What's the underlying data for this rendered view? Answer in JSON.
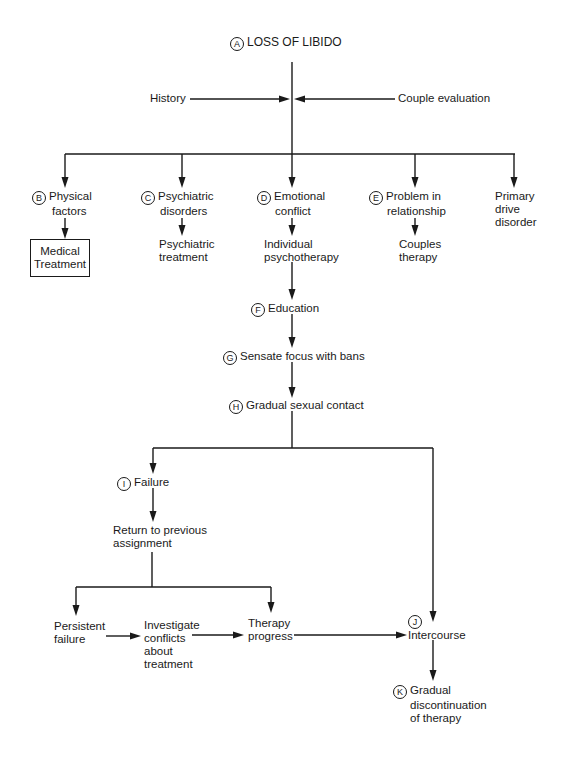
{
  "diagram": {
    "type": "flowchart",
    "title": "LOSS OF LIBIDO",
    "nodes": {
      "A": {
        "badge": "A",
        "label": "LOSS OF LIBIDO"
      },
      "history": {
        "label": "History"
      },
      "couple_eval": {
        "label": "Couple evaluation"
      },
      "B": {
        "badge": "B",
        "line1": "Physical",
        "line2": "factors"
      },
      "B_tx": {
        "line1": "Medical",
        "line2": "Treatment"
      },
      "C": {
        "badge": "C",
        "line1": "Psychiatric",
        "line2": "disorders"
      },
      "C_tx": {
        "line1": "Psychiatric",
        "line2": "treatment"
      },
      "D": {
        "badge": "D",
        "line1": "Emotional",
        "line2": "conflict"
      },
      "D_tx": {
        "line1": "Individual",
        "line2": "psychotherapy"
      },
      "E": {
        "badge": "E",
        "line1": "Problem in",
        "line2": "relationship"
      },
      "E_tx": {
        "line1": "Couples",
        "line2": "therapy"
      },
      "primary": {
        "line1": "Primary",
        "line2": "drive",
        "line3": "disorder"
      },
      "F": {
        "badge": "F",
        "label": "Education"
      },
      "G": {
        "badge": "G",
        "label": "Sensate focus with bans"
      },
      "H": {
        "badge": "H",
        "label": "Gradual sexual contact"
      },
      "I": {
        "badge": "I",
        "label": "Failure"
      },
      "return": {
        "line1": "Return to previous",
        "line2": "assignment"
      },
      "persistent": {
        "line1": "Persistent",
        "line2": "failure"
      },
      "investigate": {
        "line1": "Investigate",
        "line2": "conflicts",
        "line3": "about",
        "line4": "treatment"
      },
      "progress": {
        "line1": "Therapy",
        "line2": "progress"
      },
      "J": {
        "badge": "J",
        "label": "Intercourse"
      },
      "K": {
        "badge": "K",
        "line1": "Gradual",
        "line2": "discontinuation",
        "line3": "of therapy"
      }
    },
    "edges": [
      [
        "history",
        "A"
      ],
      [
        "couple_eval",
        "A"
      ],
      [
        "A",
        "B"
      ],
      [
        "A",
        "C"
      ],
      [
        "A",
        "D"
      ],
      [
        "A",
        "E"
      ],
      [
        "A",
        "primary"
      ],
      [
        "B",
        "B_tx"
      ],
      [
        "C",
        "C_tx"
      ],
      [
        "D",
        "D_tx"
      ],
      [
        "E",
        "E_tx"
      ],
      [
        "D_tx",
        "F"
      ],
      [
        "F",
        "G"
      ],
      [
        "G",
        "H"
      ],
      [
        "H",
        "I"
      ],
      [
        "H",
        "J"
      ],
      [
        "I",
        "return"
      ],
      [
        "return",
        "persistent"
      ],
      [
        "return",
        "progress"
      ],
      [
        "persistent",
        "investigate"
      ],
      [
        "investigate",
        "progress"
      ],
      [
        "progress",
        "J"
      ],
      [
        "J",
        "K"
      ]
    ]
  }
}
